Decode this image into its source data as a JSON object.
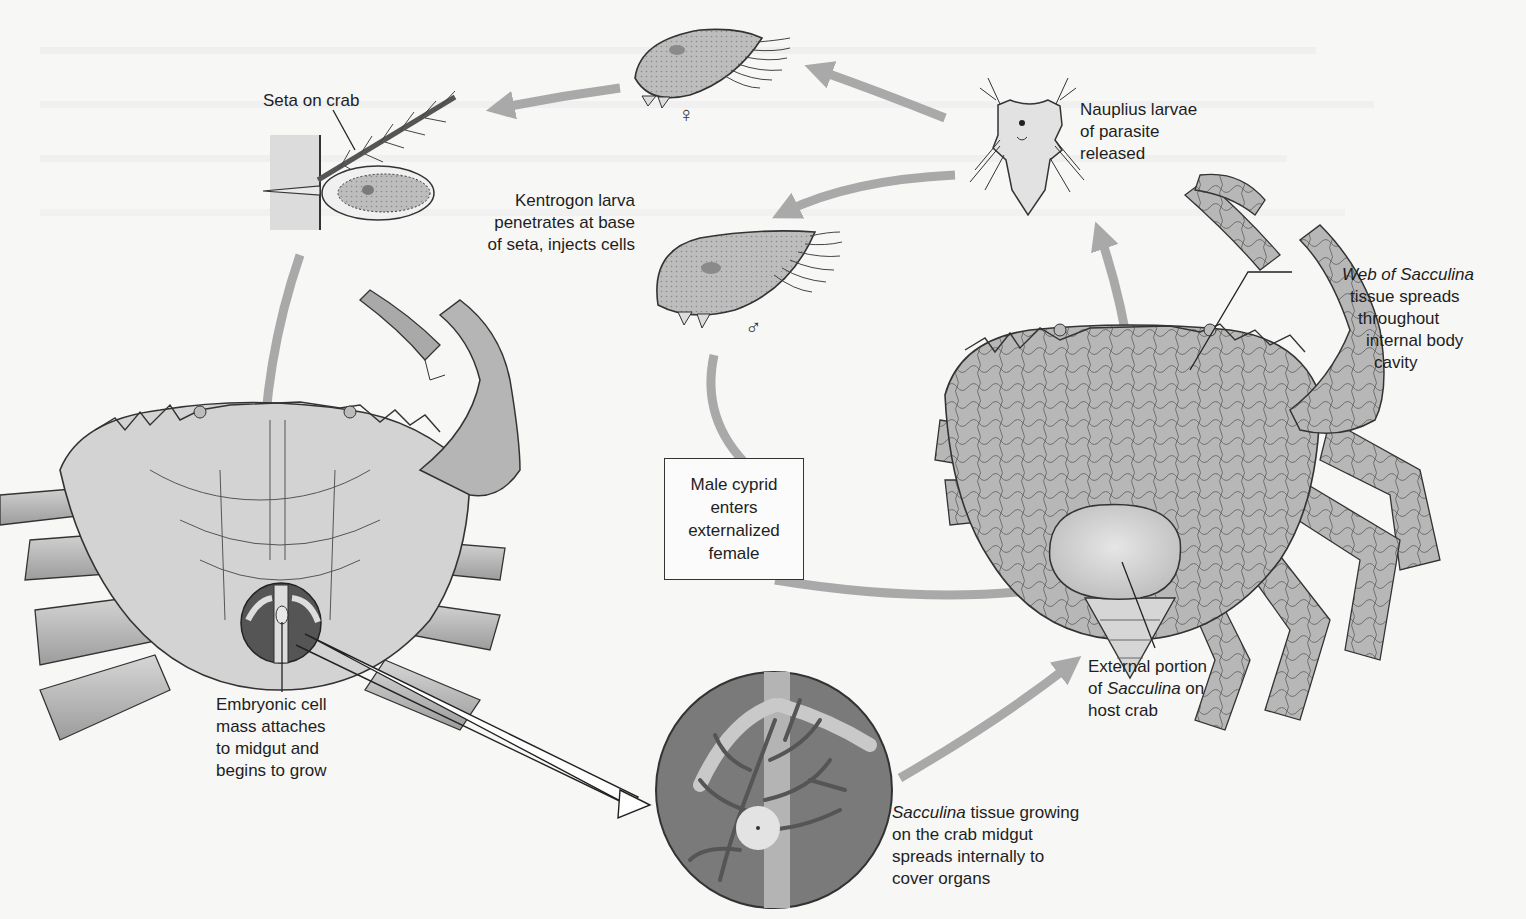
{
  "figure": {
    "colors": {
      "background": "#f7f7f6",
      "arrow": "#a9a9a9",
      "crab_fill": "#c9c9c9",
      "crab_dark": "#6f6f6f",
      "circle_fill": "#7a7a7a",
      "text": "#1e1e1e"
    }
  },
  "labels": {
    "seta": {
      "lines": [
        "Seta on crab"
      ]
    },
    "kentrogon": {
      "lines": [
        "Kentrogon larva",
        "penetrates at base",
        "of seta, injects cells"
      ]
    },
    "nauplius": {
      "lines": [
        "Nauplius larvae",
        "of parasite",
        "released"
      ]
    },
    "web": {
      "italic_part": "Web of Sacculina",
      "lines": [
        "tissue spreads",
        "throughout",
        "internal body",
        "cavity"
      ]
    },
    "male_cyprid": {
      "lines": [
        "Male cyprid",
        "enters",
        "externalized",
        "female"
      ]
    },
    "external": {
      "line1": "External portion",
      "line2_prefix": "of ",
      "line2_italic": "Sacculina",
      "line2_suffix": " on",
      "line3": "host crab"
    },
    "embryonic": {
      "lines": [
        "Embryonic cell",
        "mass attaches",
        "to midgut and",
        "begins to grow"
      ]
    },
    "growing": {
      "italic_part": "Sacculina",
      "line1_suffix": " tissue growing",
      "lines": [
        "on the crab midgut",
        "spreads internally to",
        "cover organs"
      ]
    }
  },
  "symbols": {
    "female": "♀",
    "male": "♂"
  },
  "stages": [
    {
      "id": "female-cyprid",
      "name": "Female cyprid larva"
    },
    {
      "id": "male-cyprid",
      "name": "Male cyprid larva"
    },
    {
      "id": "nauplius",
      "name": "Nauplius larva"
    },
    {
      "id": "kentrogon",
      "name": "Kentrogon larva on seta"
    },
    {
      "id": "infected-crab-early",
      "name": "Crab with embryonic cell mass"
    },
    {
      "id": "midgut-magnified",
      "name": "Magnified midgut with Sacculina tissue"
    },
    {
      "id": "infected-crab-late",
      "name": "Crab with externa and internal web"
    }
  ]
}
